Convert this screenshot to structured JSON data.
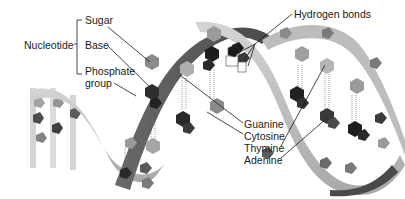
{
  "diagram": {
    "labels": {
      "nucleotide": "Nucleotide",
      "sugar": "Sugar",
      "base": "Base",
      "phosphate_line1": "Phosphate",
      "phosphate_line2": "group",
      "hydrogen_bonds": "Hydrogen bonds",
      "guanine": "Guanine",
      "cytosine": "Cytosine",
      "thymine": "Thymine",
      "adenine": "Adenine"
    },
    "colors": {
      "backbone_light": "#b9b9b9",
      "backbone_dark": "#5a5a5a",
      "guanine": "#8a8a8a",
      "cytosine": "#a8a8a8",
      "thymine": "#2a2a2a",
      "adenine": "#4a4a4a"
    }
  }
}
